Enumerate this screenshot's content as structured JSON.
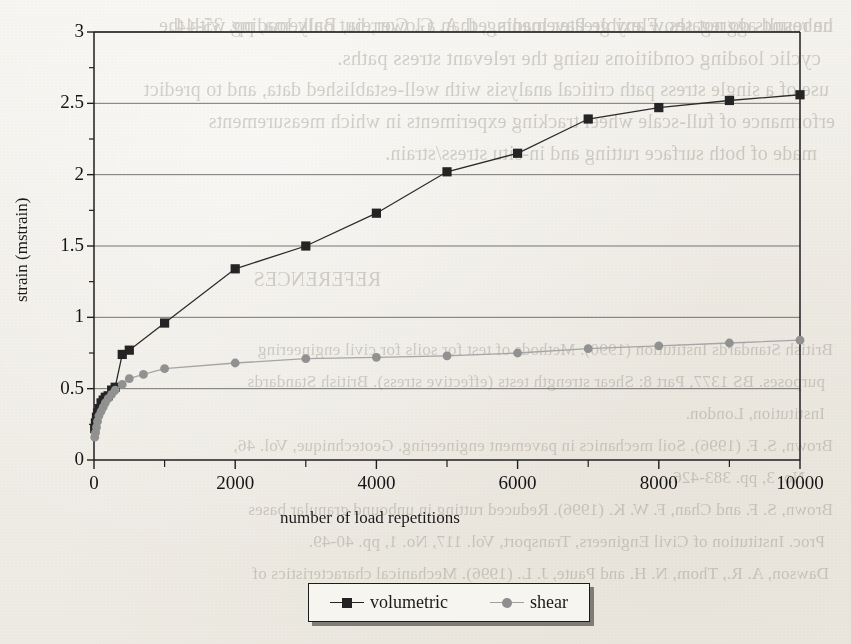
{
  "page": {
    "kind": "scanned-journal-page-figure",
    "bleed_through_lines": [
      "he results do not show any greater loading, than a lower, but only loading with the",
      "cyclic loading conditions using the relevant stress paths.",
      "use of a single stress path critical analysis with well-established data, and to predict",
      "erformance of full-scale wheel tracking experiments in which measurements",
      "made of both surface rutting and in-situ stress/strain.",
      "REFERENCES",
      "British Standards Institution (1990). Methods of test for soils for civil engineering",
      "purposes. BS 1377, Part 8: Shear strength tests (effective stress). British Standards",
      "Institution, London.",
      "Brown, S. F. (1996). Soil mechanics in pavement engineering. Geotechnique, Vol. 46,",
      "No. 3, pp. 383-426.",
      "Brown, S. F. and Chan, F. W. K. (1996). Reduced rutting in unbound granular bases",
      "Proc. Institution of Civil Engineers, Transport, Vol. 117, No. 1, pp. 40-49.",
      "Dawson, A. R., Thom, N. H. and Paute, J. L. (1996). Mechanical characteristics of",
      "unbound aggregates. Flexible Pavements, ed. A. G. Correia, Balkema, pp. 35-44."
    ]
  },
  "chart_data": {
    "type": "line",
    "title": "",
    "xlabel": "number of load repetitions",
    "ylabel": "strain (mstrain)",
    "xlim": [
      0,
      10000
    ],
    "ylim": [
      0,
      3
    ],
    "grid": "horizontal-major",
    "legend_position": "bottom-center",
    "x_ticks_major": [
      0,
      2000,
      4000,
      6000,
      8000,
      10000
    ],
    "x_tick_labels": [
      "0",
      "2000",
      "4000",
      "6000",
      "8000",
      "10000"
    ],
    "x_ticks_minor": [
      1000,
      3000,
      5000,
      7000,
      9000
    ],
    "y_ticks_major": [
      0,
      0.5,
      1,
      1.5,
      2,
      2.5,
      3
    ],
    "y_tick_labels": [
      "0",
      "0.5",
      "1",
      "1.5",
      "2",
      "2.5",
      "3"
    ],
    "y_ticks_minor": [
      0.25,
      0.75,
      1.25,
      1.75,
      2.25,
      2.75
    ],
    "series": [
      {
        "name": "volumetric",
        "marker": "square",
        "color": "#232323",
        "points": [
          [
            10,
            0.22
          ],
          [
            20,
            0.26
          ],
          [
            35,
            0.3
          ],
          [
            50,
            0.33
          ],
          [
            70,
            0.36
          ],
          [
            100,
            0.4
          ],
          [
            130,
            0.42
          ],
          [
            160,
            0.44
          ],
          [
            200,
            0.45
          ],
          [
            250,
            0.49
          ],
          [
            300,
            0.51
          ],
          [
            400,
            0.74
          ],
          [
            500,
            0.77
          ],
          [
            1000,
            0.96
          ],
          [
            2000,
            1.34
          ],
          [
            3000,
            1.5
          ],
          [
            4000,
            1.73
          ],
          [
            5000,
            2.02
          ],
          [
            6000,
            2.15
          ],
          [
            7000,
            2.39
          ],
          [
            8000,
            2.47
          ],
          [
            9000,
            2.52
          ],
          [
            10000,
            2.56
          ]
        ]
      },
      {
        "name": "shear",
        "marker": "circle",
        "color": "#8e8e8e",
        "points": [
          [
            10,
            0.16
          ],
          [
            20,
            0.19
          ],
          [
            35,
            0.23
          ],
          [
            50,
            0.27
          ],
          [
            70,
            0.31
          ],
          [
            100,
            0.34
          ],
          [
            130,
            0.37
          ],
          [
            160,
            0.4
          ],
          [
            200,
            0.43
          ],
          [
            250,
            0.46
          ],
          [
            300,
            0.49
          ],
          [
            400,
            0.53
          ],
          [
            500,
            0.57
          ],
          [
            700,
            0.6
          ],
          [
            1000,
            0.64
          ],
          [
            2000,
            0.68
          ],
          [
            3000,
            0.71
          ],
          [
            4000,
            0.72
          ],
          [
            5000,
            0.73
          ],
          [
            6000,
            0.75
          ],
          [
            7000,
            0.78
          ],
          [
            8000,
            0.8
          ],
          [
            9000,
            0.82
          ],
          [
            10000,
            0.84
          ]
        ]
      }
    ]
  }
}
